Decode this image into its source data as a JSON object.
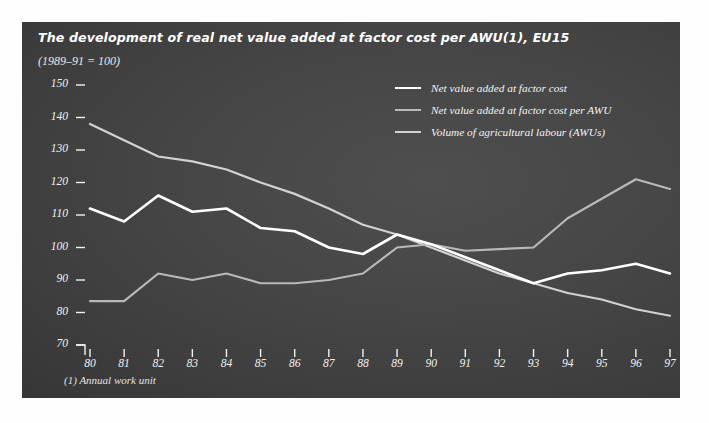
{
  "title": "The development of real net value added at factor cost per AWU(1), EU15",
  "subtitle": "(1989–91 = 100)",
  "footnote": "(1) Annual work unit",
  "colors": {
    "panel_dark": "#3c3c3c",
    "series_white": "#ffffff",
    "series_mid_gray": "#b9b9b9",
    "series_light_gray": "#d2d2d2",
    "axis_text": "#f2f2f2",
    "page_background": "#ffffff"
  },
  "legend": {
    "position": "inside-top-right",
    "entries": [
      {
        "label": "Net value added at factor cost",
        "color": "#ffffff"
      },
      {
        "label": "Net value added at factor cost per AWU",
        "color": "#b9b9b9"
      },
      {
        "label": "Volume of agricultural labour (AWUs)",
        "color": "#d2d2d2"
      }
    ]
  },
  "chart_data": {
    "type": "line",
    "title": "The development of real net value added at factor cost per AWU(1), EU15",
    "subtitle": "(1989–91 = 100)",
    "xlabel": "",
    "ylabel": "",
    "grid": false,
    "legend_position": "inside-top-right",
    "x": [
      80,
      81,
      82,
      83,
      84,
      85,
      86,
      87,
      88,
      89,
      90,
      91,
      92,
      93,
      94,
      95,
      96,
      97
    ],
    "categories": [
      "80",
      "81",
      "82",
      "83",
      "84",
      "85",
      "86",
      "87",
      "88",
      "89",
      "90",
      "91",
      "92",
      "93",
      "94",
      "95",
      "96",
      "97"
    ],
    "xlim": [
      80,
      97
    ],
    "ylim": [
      70,
      150
    ],
    "yticks": [
      70,
      80,
      90,
      100,
      110,
      120,
      130,
      140,
      150
    ],
    "xticks": [
      80,
      81,
      82,
      83,
      84,
      85,
      86,
      87,
      88,
      89,
      90,
      91,
      92,
      93,
      94,
      95,
      96,
      97
    ],
    "series": [
      {
        "name": "Net value added at factor cost",
        "color": "#ffffff",
        "values": [
          112,
          108,
          116,
          111,
          112,
          106,
          105,
          100,
          98,
          104,
          101,
          97,
          93,
          89,
          92,
          93,
          95,
          92
        ]
      },
      {
        "name": "Net value added at factor cost per AWU",
        "color": "#b9b9b9",
        "values": [
          83.5,
          83.5,
          92,
          90,
          92,
          89,
          89,
          90,
          92,
          100,
          101,
          99,
          99.5,
          100,
          109,
          115,
          121,
          118
        ]
      },
      {
        "name": "Volume of agricultural labour (AWUs)",
        "color": "#d2d2d2",
        "values": [
          138,
          133,
          128,
          126.5,
          124,
          120,
          116.5,
          112,
          107,
          104,
          100,
          96,
          92,
          89,
          86,
          84,
          81,
          79
        ]
      }
    ]
  }
}
